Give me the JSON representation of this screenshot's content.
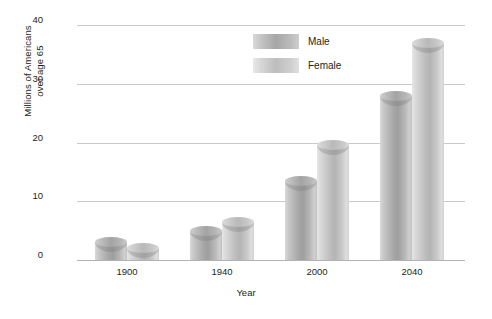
{
  "chart_data": {
    "type": "bar",
    "title": "",
    "subtitle": "",
    "xlabel": "Year",
    "ylabel": "Millions of Americans over age 65",
    "ylabel_line1": "Millions of Americans",
    "ylabel_line2": "over age 65",
    "categories": [
      "1900",
      "1940",
      "2000",
      "2040"
    ],
    "series": [
      {
        "name": "Male",
        "values": [
          3,
          5,
          13.5,
          28
        ]
      },
      {
        "name": "Female",
        "values": [
          2,
          6.5,
          19.5,
          37
        ]
      }
    ],
    "ylim": [
      0,
      40
    ],
    "yticks": [
      0,
      10,
      20,
      30,
      40
    ],
    "ytick_labels": [
      "0",
      "10",
      "20",
      "30",
      "40"
    ],
    "grid": true,
    "grid_axis": "y",
    "legend_position": "top-center-inside",
    "legend": [
      {
        "label": "Male",
        "color": "#a6a6a6"
      },
      {
        "label": "Female",
        "color": "#c4c4c4"
      }
    ],
    "colors": {
      "male": "#a6a6a6",
      "female": "#c4c4c4",
      "gridline": "#c9c9c9",
      "baseline": "#b3b3b3",
      "text": "#231f20",
      "background": "#ffffff"
    }
  }
}
